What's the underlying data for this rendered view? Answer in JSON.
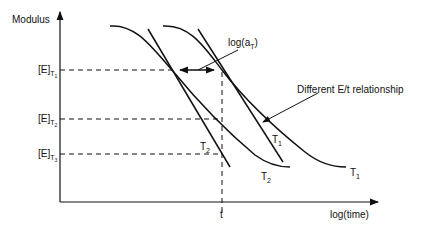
{
  "diagram": {
    "y_axis_label": "Modulus",
    "x_axis_label": "log(time)",
    "x_marker": "t",
    "levels": [
      {
        "base": "[E]",
        "sub": "T",
        "subsub": "1"
      },
      {
        "base": "[E]",
        "sub": "T",
        "subsub": "2"
      },
      {
        "base": "[E]",
        "sub": "T",
        "subsub": "3"
      }
    ],
    "shift_label": {
      "base": "log(a",
      "sub": "T",
      "close": ")"
    },
    "annotation": "Different E/t relationship",
    "curve_labels": [
      {
        "base": "T",
        "sub": "2",
        "note": "straight line, left"
      },
      {
        "base": "T",
        "sub": "1",
        "note": "straight line, right"
      },
      {
        "base": "T",
        "sub": "2",
        "note": "curve, left"
      },
      {
        "base": "T",
        "sub": "1",
        "note": "curve, right"
      }
    ],
    "line_color": "#111111"
  }
}
